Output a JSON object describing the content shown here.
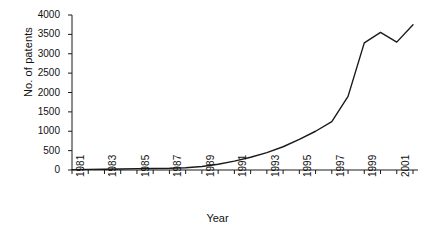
{
  "chart_data": {
    "type": "line",
    "title": "",
    "xlabel": "Year",
    "ylabel": "No. of patents",
    "xlim": [
      1981,
      2002
    ],
    "ylim": [
      0,
      4000
    ],
    "grid": false,
    "legend": "none",
    "series_name": "No. of patents",
    "line_color": "#1a1a1a",
    "x": [
      1981,
      1982,
      1983,
      1984,
      1985,
      1986,
      1987,
      1988,
      1989,
      1990,
      1991,
      1992,
      1993,
      1994,
      1995,
      1996,
      1997,
      1998,
      1999,
      2000,
      2001,
      2002
    ],
    "values": [
      10,
      15,
      20,
      25,
      35,
      40,
      45,
      60,
      90,
      150,
      230,
      330,
      450,
      600,
      790,
      1000,
      1250,
      1900,
      3280,
      3550,
      3300,
      3750
    ],
    "categories": [
      "1981",
      "1982",
      "1983",
      "1984",
      "1985",
      "1986",
      "1987",
      "1988",
      "1989",
      "1990",
      "1991",
      "1992",
      "1993",
      "1994",
      "1995",
      "1996",
      "1997",
      "1998",
      "1999",
      "2000",
      "2001",
      "2002"
    ],
    "x_tick_values": [
      1981,
      1982,
      1983,
      1984,
      1985,
      1986,
      1987,
      1988,
      1989,
      1990,
      1991,
      1992,
      1993,
      1994,
      1995,
      1996,
      1997,
      1998,
      1999,
      2000,
      2001,
      2002
    ],
    "x_tick_labels": [
      "1981",
      "",
      "1983",
      "",
      "1985",
      "",
      "1987",
      "",
      "1989",
      "",
      "1991",
      "",
      "1993",
      "",
      "1995",
      "",
      "1997",
      "",
      "1999",
      "",
      "2001",
      ""
    ],
    "y_ticks": [
      0,
      500,
      1000,
      1500,
      2000,
      2500,
      3000,
      3500,
      4000
    ],
    "y_tick_labels": [
      "0",
      "500",
      "1000",
      "1500",
      "2000",
      "2500",
      "3000",
      "3500",
      "4000"
    ]
  },
  "axes": {
    "x_title": "Year",
    "y_title": "No. of patents"
  }
}
